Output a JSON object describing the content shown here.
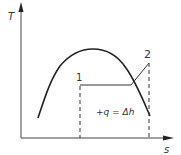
{
  "diagram": {
    "axes": {
      "y_label": "T",
      "x_label": "s"
    },
    "points": [
      {
        "label": "1"
      },
      {
        "label": "2"
      }
    ],
    "annotation": "+q = Δh",
    "colors": {
      "line": "#222222",
      "axis": "#444444",
      "text": "#333333"
    }
  }
}
